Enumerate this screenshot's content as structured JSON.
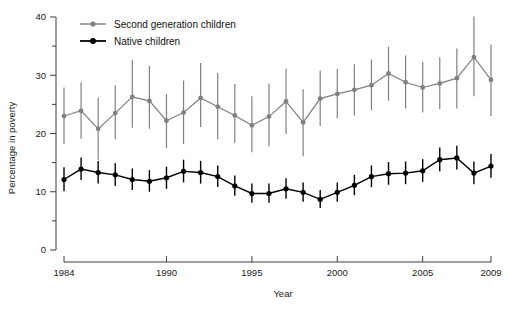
{
  "chart_data": {
    "type": "line",
    "title": "",
    "xlabel": "Year",
    "ylabel": "Percentage in poverty",
    "xlim": [
      1984,
      2009
    ],
    "ylim": [
      0,
      40
    ],
    "x": [
      1984,
      1985,
      1986,
      1987,
      1988,
      1989,
      1990,
      1991,
      1992,
      1993,
      1994,
      1995,
      1996,
      1997,
      1998,
      1999,
      2000,
      2001,
      2002,
      2003,
      2004,
      2005,
      2006,
      2007,
      2008,
      2009
    ],
    "xticks": [
      1984,
      1990,
      1995,
      2000,
      2005,
      2009
    ],
    "xtick_labels": [
      "1984",
      "1990",
      "1995",
      "2000",
      "2005",
      "2009"
    ],
    "yticks": [
      0,
      10,
      20,
      30,
      40
    ],
    "ytick_labels": [
      "0",
      "10",
      "20",
      "30",
      "40"
    ],
    "yticks_minor": [
      5,
      15,
      25,
      35
    ],
    "grid": false,
    "legend_position": "top-left",
    "series": [
      {
        "name": "Second generation children",
        "color": "#808080",
        "values": [
          23.0,
          23.9,
          20.8,
          23.5,
          26.3,
          25.6,
          22.2,
          23.6,
          26.1,
          24.6,
          23.1,
          21.4,
          22.9,
          25.5,
          21.9,
          26.0,
          26.8,
          27.5,
          28.3,
          30.3,
          28.8,
          27.9,
          28.6,
          29.5,
          33.1,
          29.2
        ],
        "err_low": [
          18.2,
          19.1,
          15.5,
          19.0,
          21.0,
          20.8,
          17.5,
          18.2,
          21.1,
          19.0,
          18.4,
          16.8,
          17.8,
          19.9,
          16.1,
          21.3,
          22.6,
          23.1,
          24.0,
          25.6,
          24.3,
          23.6,
          24.2,
          24.3,
          26.4,
          23.0
        ],
        "err_high": [
          27.9,
          28.8,
          26.2,
          28.3,
          32.6,
          31.6,
          26.8,
          29.1,
          32.1,
          30.4,
          28.5,
          26.4,
          28.6,
          31.1,
          27.6,
          30.8,
          31.1,
          31.9,
          32.7,
          34.9,
          33.4,
          32.3,
          33.1,
          34.6,
          40.1,
          35.3
        ]
      },
      {
        "name": "Native children",
        "color": "#000000",
        "values": [
          12.1,
          13.9,
          13.3,
          12.9,
          12.1,
          11.8,
          12.4,
          13.5,
          13.3,
          12.6,
          11.0,
          9.7,
          9.7,
          10.5,
          9.9,
          8.7,
          9.9,
          11.1,
          12.6,
          13.1,
          13.2,
          13.6,
          15.5,
          15.8,
          13.2,
          14.4
        ],
        "err_low": [
          10.1,
          12.0,
          11.4,
          11.0,
          10.3,
          10.0,
          10.5,
          11.6,
          11.4,
          10.8,
          9.3,
          8.1,
          8.1,
          8.8,
          8.3,
          7.2,
          8.3,
          9.4,
          10.8,
          11.2,
          11.3,
          11.7,
          13.5,
          13.8,
          11.3,
          12.4
        ],
        "err_high": [
          14.2,
          15.9,
          15.3,
          14.9,
          14.0,
          13.7,
          14.3,
          15.5,
          15.3,
          14.5,
          12.8,
          11.4,
          11.4,
          12.3,
          11.6,
          10.3,
          11.6,
          12.9,
          14.5,
          15.1,
          15.2,
          15.6,
          17.6,
          17.9,
          15.2,
          16.5
        ]
      }
    ],
    "legend": [
      {
        "label": "Second generation children",
        "color": "#808080"
      },
      {
        "label": "Native children",
        "color": "#000000"
      }
    ]
  }
}
